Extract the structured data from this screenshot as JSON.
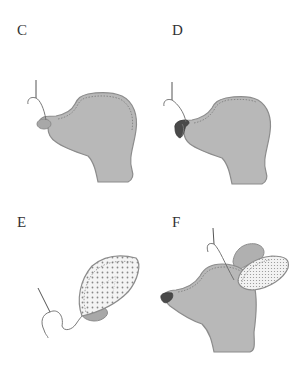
{
  "figure": {
    "panels": [
      {
        "id": "C",
        "label": "C",
        "description": "Head with nose being stitched; needle and thread at nose tip"
      },
      {
        "id": "D",
        "label": "D",
        "description": "Head with dark shaded nose; needle and thread above nose"
      },
      {
        "id": "E",
        "label": "E",
        "description": "Dotted-fabric ear piece being stitched with needle and thread"
      },
      {
        "id": "F",
        "label": "F",
        "description": "Head with dark nose and two ears attached; needle stitching ear to head"
      }
    ],
    "colors": {
      "fill": "#b8b8b8",
      "outline": "#8c8c8c",
      "stitch": "#7a7a7a",
      "nose_dark": "#4a4a4a",
      "thread": "#6a6a6a",
      "dot": "#888888",
      "label": "#333333"
    }
  }
}
